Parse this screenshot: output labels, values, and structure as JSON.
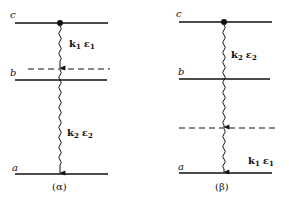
{
  "diagram": {
    "panels": [
      {
        "id": "alpha",
        "caption": "(α)",
        "levels": {
          "c": {
            "label": "c",
            "y": 23
          },
          "virtual": {
            "y": 69,
            "style": "dashed"
          },
          "b": {
            "label": "b",
            "y": 80
          },
          "a": {
            "label": "a",
            "y": 174
          }
        },
        "transitions": [
          {
            "from": "c",
            "to": "virtual",
            "label_k": "k",
            "label_k_sub": "1",
            "label_e": "ε",
            "label_e_sub": "1"
          },
          {
            "from": "virtual",
            "to": "a",
            "label_k": "k",
            "label_k_sub": "2",
            "label_e": "ε",
            "label_e_sub": "2"
          }
        ]
      },
      {
        "id": "beta",
        "caption": "(β)",
        "levels": {
          "c": {
            "label": "c",
            "y": 22
          },
          "b": {
            "label": "b",
            "y": 79
          },
          "virtual": {
            "y": 128,
            "style": "dashed"
          },
          "a": {
            "label": "a",
            "y": 173
          }
        },
        "transitions": [
          {
            "from": "c",
            "to": "virtual",
            "label_k": "k",
            "label_k_sub": "2",
            "label_e": "ε",
            "label_e_sub": "2"
          },
          {
            "from": "virtual",
            "to": "a",
            "label_k": "k",
            "label_k_sub": "1",
            "label_e": "ε",
            "label_e_sub": "1"
          }
        ]
      }
    ]
  }
}
